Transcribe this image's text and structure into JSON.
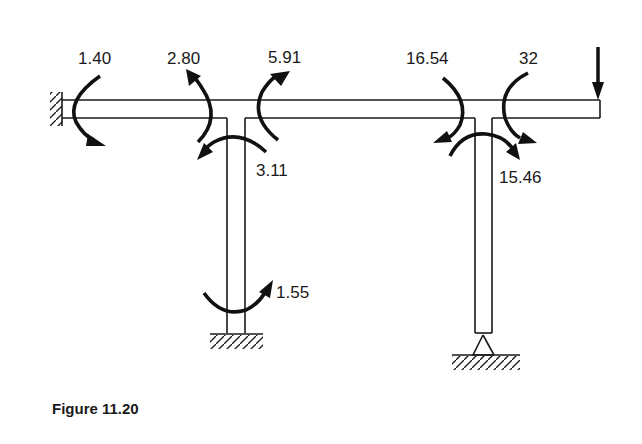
{
  "figure": {
    "caption": "Figure 11.20",
    "type": "frame bending moment diagram",
    "applied_load": "point-load-downward-at-free-end",
    "supports": {
      "left_end": "fixed-wall",
      "left_column_base": "fixed-ground",
      "right_column_base": "pin"
    },
    "moments": [
      {
        "id": "m-left-wall",
        "label": "1.40",
        "location": "beam at fixed wall"
      },
      {
        "id": "m-beam-left-joint-west",
        "label": "2.80",
        "location": "beam left of left joint"
      },
      {
        "id": "m-beam-left-joint-east",
        "label": "5.91",
        "location": "beam right of left joint"
      },
      {
        "id": "m-left-column-top",
        "label": "3.11",
        "location": "left column top"
      },
      {
        "id": "m-left-column-base",
        "label": "1.55",
        "location": "left column base"
      },
      {
        "id": "m-beam-right-joint-west",
        "label": "16.54",
        "location": "beam left of right joint"
      },
      {
        "id": "m-beam-right-joint-east",
        "label": "32",
        "location": "beam right of right joint"
      },
      {
        "id": "m-right-column-top",
        "label": "15.46",
        "location": "right column top"
      }
    ]
  }
}
